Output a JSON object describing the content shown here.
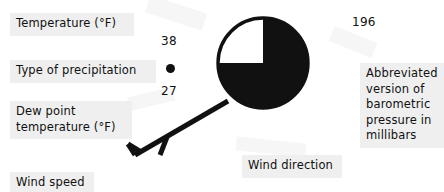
{
  "diagram": {
    "background_color": "#ffffff",
    "ink_color": "#111111",
    "label_plate_color": "#efefef"
  },
  "labels": {
    "temperature": "Temperature (°F)",
    "precipitation_type": "Type of precipitation",
    "dew_point": "Dew point\ntemperature (°F)",
    "wind_speed": "Wind speed",
    "wind_direction": "Wind direction",
    "pressure": "Abbreviated\nversion of\nbarometric\npressure in\nmillibars"
  },
  "values": {
    "temperature": "38",
    "dew_point": "27",
    "pressure": "196",
    "precipitation_symbol": "rain-dot"
  },
  "station_symbol": {
    "name": "sky-cover-circle",
    "fill_color": "#111111",
    "clear_quadrant": "upper-left",
    "cloud_cover_fraction": "3/4",
    "center_x": 263,
    "center_y": 63,
    "radius": 45
  },
  "wind_barb": {
    "name": "wind-barb",
    "shaft_from_x": 224,
    "shaft_from_y": 104,
    "shaft_to_x": 134,
    "shaft_to_y": 156,
    "barbs": [
      "full-barb",
      "half-barb"
    ],
    "stroke_color": "#111111"
  }
}
